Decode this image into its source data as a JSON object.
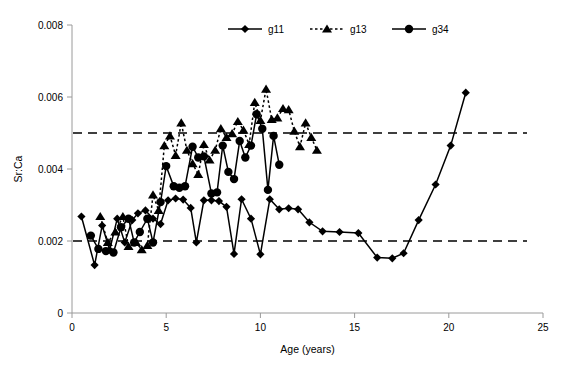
{
  "chart_data": {
    "type": "line",
    "title": "",
    "xlabel": "Age (years)",
    "ylabel": "Sr:Ca",
    "xlim": [
      0,
      25
    ],
    "ylim": [
      0,
      0.008
    ],
    "xticks": [
      "0",
      "5",
      "10",
      "15",
      "20",
      "25"
    ],
    "xtick_values": [
      0,
      5,
      10,
      15,
      20,
      25
    ],
    "yticks": [
      "0",
      "0.002",
      "0.004",
      "0.006",
      "0.008"
    ],
    "ytick_values": [
      0,
      0.002,
      0.004,
      0.006,
      0.008
    ],
    "grid": false,
    "legend_position": "top-center",
    "reference_lines": [
      {
        "axis": "y",
        "value": 0.005,
        "style": "dashed"
      },
      {
        "axis": "y",
        "value": 0.002,
        "style": "dashed"
      }
    ],
    "series": [
      {
        "name": "g11",
        "marker": "diamond",
        "line_style": "solid",
        "color": "#000000",
        "points": [
          [
            0.5,
            0.00268
          ],
          [
            1.2,
            0.00133
          ],
          [
            1.6,
            0.00243
          ],
          [
            2.0,
            0.00175
          ],
          [
            2.4,
            0.00262
          ],
          [
            2.8,
            0.00196
          ],
          [
            3.2,
            0.00258
          ],
          [
            3.5,
            0.00277
          ],
          [
            3.9,
            0.00285
          ],
          [
            4.3,
            0.00262
          ],
          [
            4.7,
            0.00247
          ],
          [
            5.1,
            0.00313
          ],
          [
            5.5,
            0.00318
          ],
          [
            5.9,
            0.00315
          ],
          [
            6.3,
            0.00292
          ],
          [
            6.6,
            0.00196
          ],
          [
            7.0,
            0.00313
          ],
          [
            7.4,
            0.00313
          ],
          [
            7.8,
            0.00311
          ],
          [
            8.2,
            0.00295
          ],
          [
            8.6,
            0.00164
          ],
          [
            9.0,
            0.00316
          ],
          [
            9.5,
            0.00262
          ],
          [
            10.0,
            0.00163
          ],
          [
            10.5,
            0.00316
          ],
          [
            11.0,
            0.00288
          ],
          [
            11.5,
            0.00291
          ],
          [
            12.0,
            0.00288
          ],
          [
            12.6,
            0.00252
          ],
          [
            13.3,
            0.00227
          ],
          [
            14.2,
            0.00225
          ],
          [
            15.2,
            0.00222
          ],
          [
            16.2,
            0.00154
          ],
          [
            17.0,
            0.00152
          ],
          [
            17.6,
            0.00166
          ],
          [
            18.4,
            0.00258
          ],
          [
            19.3,
            0.00357
          ],
          [
            20.1,
            0.00465
          ],
          [
            20.9,
            0.00612
          ]
        ]
      },
      {
        "name": "g13",
        "marker": "triangle",
        "line_style": "dashed",
        "color": "#000000",
        "points": [
          [
            1.5,
            0.00268
          ],
          [
            1.9,
            0.00196
          ],
          [
            2.3,
            0.00225
          ],
          [
            2.7,
            0.00268
          ],
          [
            3.0,
            0.00185
          ],
          [
            3.4,
            0.00196
          ],
          [
            3.7,
            0.00176
          ],
          [
            4.0,
            0.00188
          ],
          [
            4.3,
            0.00328
          ],
          [
            4.6,
            0.00285
          ],
          [
            4.9,
            0.00465
          ],
          [
            5.2,
            0.00492
          ],
          [
            5.5,
            0.00438
          ],
          [
            5.8,
            0.00528
          ],
          [
            6.1,
            0.00452
          ],
          [
            6.4,
            0.00415
          ],
          [
            6.7,
            0.00385
          ],
          [
            7.0,
            0.00468
          ],
          [
            7.3,
            0.00425
          ],
          [
            7.6,
            0.00452
          ],
          [
            7.9,
            0.00512
          ],
          [
            8.2,
            0.00488
          ],
          [
            8.5,
            0.00498
          ],
          [
            8.8,
            0.00532
          ],
          [
            9.1,
            0.00508
          ],
          [
            9.4,
            0.00468
          ],
          [
            9.7,
            0.00585
          ],
          [
            10.0,
            0.00535
          ],
          [
            10.3,
            0.00622
          ],
          [
            10.6,
            0.00538
          ],
          [
            10.9,
            0.00542
          ],
          [
            11.2,
            0.00568
          ],
          [
            11.5,
            0.00565
          ],
          [
            11.8,
            0.00505
          ],
          [
            12.1,
            0.00462
          ],
          [
            12.4,
            0.00528
          ],
          [
            12.7,
            0.00488
          ],
          [
            13.0,
            0.00452
          ]
        ]
      },
      {
        "name": "g34",
        "marker": "circle",
        "line_style": "solid",
        "color": "#000000",
        "points": [
          [
            1.0,
            0.00215
          ],
          [
            1.4,
            0.00178
          ],
          [
            1.8,
            0.00172
          ],
          [
            2.2,
            0.00168
          ],
          [
            2.6,
            0.00238
          ],
          [
            3.0,
            0.00262
          ],
          [
            3.3,
            0.00196
          ],
          [
            3.6,
            0.00225
          ],
          [
            4.0,
            0.00262
          ],
          [
            4.3,
            0.00196
          ],
          [
            4.7,
            0.00308
          ],
          [
            5.0,
            0.00408
          ],
          [
            5.4,
            0.00352
          ],
          [
            5.7,
            0.00348
          ],
          [
            6.0,
            0.00352
          ],
          [
            6.4,
            0.00462
          ],
          [
            6.7,
            0.00432
          ],
          [
            7.0,
            0.00435
          ],
          [
            7.4,
            0.00332
          ],
          [
            7.7,
            0.00335
          ],
          [
            8.0,
            0.00465
          ],
          [
            8.3,
            0.00392
          ],
          [
            8.6,
            0.00372
          ],
          [
            8.9,
            0.00478
          ],
          [
            9.2,
            0.00432
          ],
          [
            9.5,
            0.00465
          ],
          [
            9.8,
            0.00552
          ],
          [
            10.1,
            0.00512
          ],
          [
            10.4,
            0.00342
          ],
          [
            10.7,
            0.00492
          ],
          [
            11.0,
            0.00412
          ]
        ]
      }
    ]
  },
  "legend": {
    "items": [
      {
        "label": "g11",
        "marker": "diamond",
        "line_style": "solid"
      },
      {
        "label": "g13",
        "marker": "triangle",
        "line_style": "dashed"
      },
      {
        "label": "g34",
        "marker": "circle",
        "line_style": "solid"
      }
    ]
  }
}
